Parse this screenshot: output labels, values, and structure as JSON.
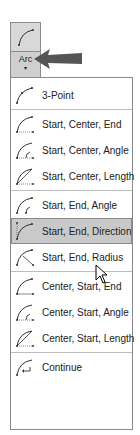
{
  "ribbon_button": {
    "label": "Arc",
    "caret": "▾",
    "icon": "arc-icon"
  },
  "pointer_arrow": {
    "color": "#555555"
  },
  "menu": {
    "groups": [
      {
        "items": [
          {
            "label": "3-Point",
            "icon": "arc-3point-icon"
          }
        ]
      },
      {
        "items": [
          {
            "label": "Start, Center, End",
            "icon": "arc-start-center-end-icon"
          },
          {
            "label": "Start, Center, Angle",
            "icon": "arc-start-center-angle-icon"
          },
          {
            "label": "Start, Center, Length",
            "icon": "arc-start-center-length-icon"
          }
        ]
      },
      {
        "items": [
          {
            "label": "Start, End, Angle",
            "icon": "arc-start-end-angle-icon"
          },
          {
            "label": "Start, End, Direction",
            "icon": "arc-start-end-direction-icon",
            "hovered": true
          },
          {
            "label": "Start, End, Radius",
            "icon": "arc-start-end-radius-icon"
          }
        ]
      },
      {
        "items": [
          {
            "label": "Center, Start, End",
            "icon": "arc-center-start-end-icon"
          },
          {
            "label": "Center, Start, Angle",
            "icon": "arc-center-start-angle-icon"
          },
          {
            "label": "Center, Start, Length",
            "icon": "arc-center-start-length-icon"
          }
        ]
      },
      {
        "items": [
          {
            "label": "Continue",
            "icon": "arc-continue-icon"
          }
        ]
      }
    ]
  },
  "colors": {
    "hover_bg": "#c9c9c9",
    "border": "#8a8a8a",
    "separator": "#bdbdbd"
  }
}
